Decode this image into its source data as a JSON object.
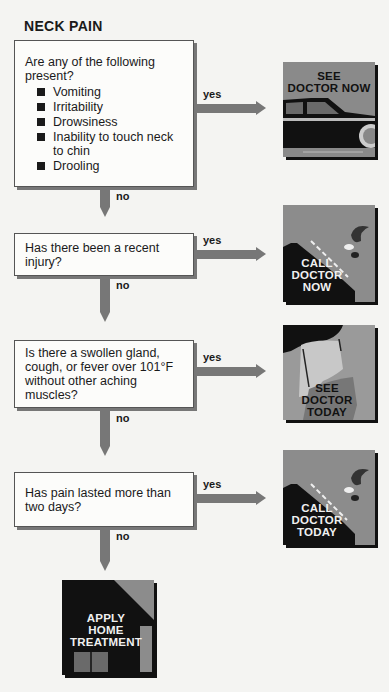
{
  "title": "NECK PAIN",
  "questions": [
    {
      "text": "Are any of the following present?",
      "items": [
        "Vomiting",
        "Irritability",
        "Drowsiness",
        "Inability to touch neck to chin",
        "Drooling"
      ],
      "yes_label": "yes",
      "no_label": "no",
      "outcome": [
        "SEE",
        "DOCTOR NOW"
      ]
    },
    {
      "text": "Has there been a recent injury?",
      "yes_label": "yes",
      "no_label": "no",
      "outcome": [
        "CALL",
        "DOCTOR",
        "NOW"
      ]
    },
    {
      "text": "Is there a swollen gland, cough, or fever over 101°F without other aching muscles?",
      "yes_label": "yes",
      "no_label": "no",
      "outcome": [
        "SEE",
        "DOCTOR",
        "TODAY"
      ]
    },
    {
      "text": "Has pain lasted more than two days?",
      "yes_label": "yes",
      "no_label": "no",
      "outcome": [
        "CALL",
        "DOCTOR",
        "TODAY"
      ]
    }
  ],
  "final": [
    "APPLY",
    "HOME",
    "TREATMENT"
  ]
}
